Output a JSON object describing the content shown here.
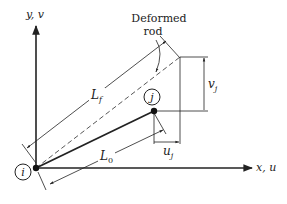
{
  "diagram": {
    "axes": {
      "y_label": "y, v",
      "x_label": "x, u"
    },
    "nodes": {
      "i": {
        "label": "i"
      },
      "j": {
        "label": "j"
      }
    },
    "annotations": {
      "deformed_rod_line1": "Deformed",
      "deformed_rod_line2": "rod",
      "Lf_main": "L",
      "Lf_sub": "f",
      "L0_main": "L",
      "L0_sub": "0",
      "vj_main": "v",
      "vj_sub": "j",
      "uj_main": "u",
      "uj_sub": "j"
    },
    "colors": {
      "line": "#222222",
      "background": "#ffffff"
    }
  }
}
